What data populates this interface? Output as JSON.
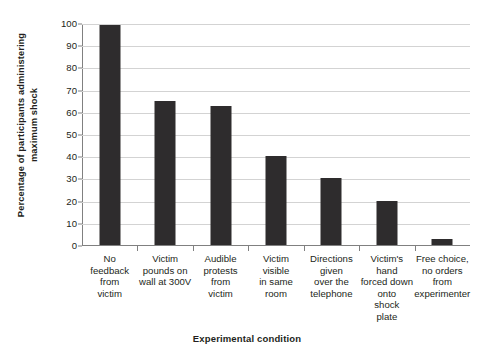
{
  "chart_data": {
    "type": "bar",
    "title": "",
    "xlabel": "Experimental condition",
    "ylabel": "Percentage of participants administering maximum shock",
    "ylabel_lines": [
      "Percentage of participants administering",
      "maximum shock"
    ],
    "categories": [
      "No feedback from victim",
      "Victim pounds on wall at 300V",
      "Audible protests from victim",
      "Victim visible in same room",
      "Directions given over the telephone",
      "Victim's hand forced down onto shock plate",
      "Free choice, no orders from experimenter"
    ],
    "category_lines": [
      [
        "No",
        "feedback",
        "from",
        "victim"
      ],
      [
        "Victim",
        "pounds on",
        "wall at 300V"
      ],
      [
        "Audible",
        "protests",
        "from",
        "victim"
      ],
      [
        "Victim",
        "visible",
        "in same",
        "room"
      ],
      [
        "Directions",
        "given",
        "over the",
        "telephone"
      ],
      [
        "Victim's",
        "hand",
        "forced down",
        "onto",
        "shock",
        "plate"
      ],
      [
        "Free choice,",
        "no orders",
        "from",
        "experimenter"
      ]
    ],
    "values": [
      99,
      65,
      62.5,
      40,
      30,
      20,
      2.5
    ],
    "ylim": [
      0,
      100
    ],
    "yticks": [
      0,
      10,
      20,
      30,
      40,
      50,
      60,
      70,
      80,
      90,
      100
    ],
    "ytick_labels": [
      "0",
      "10",
      "20",
      "30",
      "40",
      "50",
      "60",
      "70",
      "80",
      "90",
      "100"
    ],
    "grid": true,
    "legend": "none",
    "bar_color": "#2e2c2d",
    "grid_color": "#d3d3d3",
    "axis_color": "#808080",
    "background": "#ffffff"
  }
}
